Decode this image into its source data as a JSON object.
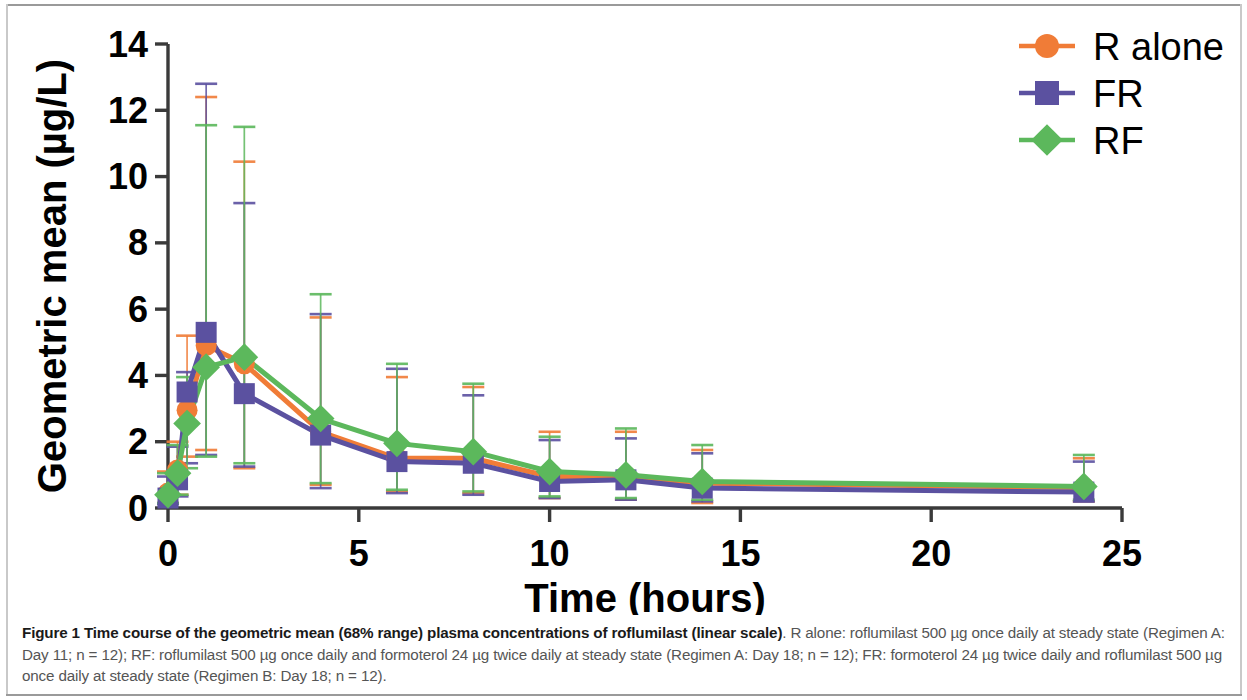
{
  "figure": {
    "caption_bold": "Figure 1 Time course of the geometric mean (68% range) plasma concentrations of roflumilast (linear scale)",
    "caption_rest": ". R alone: roflumilast 500 µg once daily at steady state (Regimen A: Day 11; n = 12); RF: roflumilast 500 µg once daily and formoterol 24 µg twice daily at steady state (Regimen A: Day 18; n = 12); FR: formoterol 24 µg twice daily and roflumilast 500 µg once daily at steady state (Regimen B: Day 18; n = 12)."
  },
  "colors": {
    "r_alone": "#f07c37",
    "fr": "#5b51a0",
    "rf": "#5cb85c",
    "axis": "#3a3a3a",
    "text": "#000000"
  },
  "chart_data": {
    "type": "line",
    "title": "",
    "xlabel": "Time (hours)",
    "ylabel": "Geometric mean (µg/L)",
    "xlim": [
      0,
      25
    ],
    "ylim": [
      0,
      14
    ],
    "xticks": [
      0,
      5,
      10,
      15,
      20,
      25
    ],
    "yticks": [
      0,
      2,
      4,
      6,
      8,
      10,
      12,
      14
    ],
    "xticklabels": [
      "0",
      "5",
      "10",
      "15",
      "20",
      "25"
    ],
    "yticklabels": [
      "0",
      "2",
      "4",
      "6",
      "8",
      "10",
      "12",
      "14"
    ],
    "grid": false,
    "legend_position": "top-right",
    "error_bars": "68% range",
    "x": [
      0,
      0.25,
      0.5,
      1,
      2,
      4,
      6,
      8,
      10,
      12,
      14,
      24
    ],
    "series": [
      {
        "name": "R alone",
        "color": "#f07c37",
        "marker": "circle",
        "values": [
          0.45,
          1.15,
          2.95,
          4.9,
          4.35,
          2.3,
          1.5,
          1.5,
          0.95,
          0.95,
          0.75,
          0.62
        ],
        "err_low": [
          0.15,
          0.4,
          1.55,
          1.75,
          1.2,
          0.7,
          0.5,
          0.45,
          0.3,
          0.25,
          0.15,
          0.2
        ],
        "err_high": [
          1.1,
          2.0,
          5.2,
          12.4,
          10.45,
          5.75,
          3.95,
          3.65,
          2.3,
          2.3,
          1.75,
          1.5
        ]
      },
      {
        "name": "FR",
        "color": "#5b51a0",
        "marker": "square",
        "values": [
          0.3,
          0.85,
          3.5,
          5.3,
          3.45,
          2.2,
          1.4,
          1.35,
          0.8,
          0.85,
          0.6,
          0.48
        ],
        "err_low": [
          0.12,
          0.35,
          1.35,
          1.6,
          1.25,
          0.6,
          0.45,
          0.4,
          0.3,
          0.25,
          0.2,
          0.2
        ],
        "err_high": [
          0.95,
          1.85,
          4.1,
          12.8,
          9.2,
          5.85,
          4.2,
          3.4,
          2.05,
          2.1,
          1.65,
          1.4
        ]
      },
      {
        "name": "RF",
        "color": "#5cb85c",
        "marker": "diamond",
        "values": [
          0.4,
          1.05,
          2.55,
          4.25,
          4.55,
          2.7,
          1.95,
          1.7,
          1.1,
          1.0,
          0.8,
          0.65
        ],
        "err_low": [
          0.15,
          0.4,
          1.2,
          1.55,
          1.35,
          0.75,
          0.55,
          0.5,
          0.35,
          0.3,
          0.25,
          0.25
        ],
        "err_high": [
          1.05,
          1.9,
          3.95,
          11.55,
          11.5,
          6.45,
          4.35,
          3.75,
          2.15,
          2.4,
          1.9,
          1.6
        ]
      }
    ],
    "legend": [
      {
        "label": "R alone",
        "color": "#f07c37",
        "marker": "circle"
      },
      {
        "label": "FR",
        "color": "#5b51a0",
        "marker": "square"
      },
      {
        "label": "RF",
        "color": "#5cb85c",
        "marker": "diamond"
      }
    ]
  }
}
